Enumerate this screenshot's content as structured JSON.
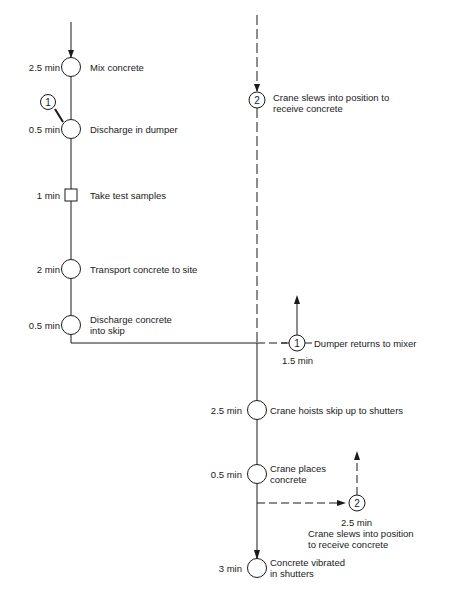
{
  "diagram": {
    "title": "",
    "main_sequence": [
      {
        "time": "2.5 min",
        "label": "Mix concrete",
        "shape": "circle"
      },
      {
        "time": "0.5 min",
        "label": "Discharge in dumper",
        "shape": "circle",
        "connector": "1"
      },
      {
        "time": "1 min",
        "label": "Take test samples",
        "shape": "square"
      },
      {
        "time": "2 min",
        "label": "Transport concrete to site",
        "shape": "circle"
      },
      {
        "time": "0.5 min",
        "label": "Discharge concrete",
        "label2": "into skip",
        "shape": "circle"
      }
    ],
    "crane_sequence": [
      {
        "time": "2.5 min",
        "label": "Crane hoists skip up to shutters",
        "shape": "circle"
      },
      {
        "time": "0.5 min",
        "label": "Crane places",
        "label2": "concrete",
        "shape": "circle"
      },
      {
        "time": "3 min",
        "label": "Concrete vibrated",
        "label2": "in shutters",
        "shape": "circle"
      }
    ],
    "connectors": {
      "c1_top": {
        "id": "1"
      },
      "c2_top": {
        "id": "2",
        "label": "Crane slews into position to",
        "label2": "receive concrete"
      },
      "c1_return": {
        "id": "1",
        "label": "Dumper returns to mixer",
        "time": "1.5 min"
      },
      "c2_return": {
        "id": "2",
        "time": "2.5 min",
        "label": "Crane slews into position",
        "label2": "to receive concrete"
      }
    }
  }
}
